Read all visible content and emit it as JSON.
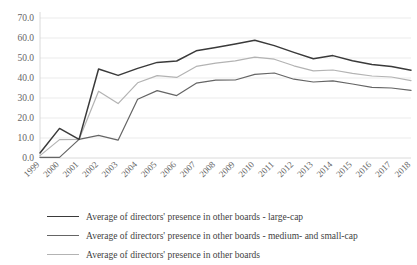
{
  "chart_data": {
    "type": "line",
    "title": "",
    "subtitle": "",
    "xlabel": "",
    "ylabel": "",
    "ylim": [
      0,
      70
    ],
    "ytick_step": 10,
    "ytick_labels": [
      "0.0",
      "10.0",
      "20.0",
      "30.0",
      "40.0",
      "50.0",
      "60.0",
      "70.0"
    ],
    "grid": true,
    "legend_position": "bottom",
    "categories": [
      "1999",
      "2000",
      "2001",
      "2002",
      "2003",
      "2004",
      "2005",
      "2006",
      "2007",
      "2008",
      "2009",
      "2010",
      "2011",
      "2012",
      "2013",
      "2014",
      "2015",
      "2016",
      "2017",
      "2018"
    ],
    "series": [
      {
        "name": "Average of directors' presence in other boards - large-cap",
        "color": "#3a3a3a",
        "values": [
          2.5,
          14.8,
          9.3,
          44.5,
          41.3,
          44.8,
          47.8,
          48.5,
          53.6,
          55.2,
          57.0,
          58.9,
          56.2,
          52.8,
          49.6,
          51.2,
          48.6,
          46.7,
          45.8,
          43.9
        ]
      },
      {
        "name": "Average of directors' presence in other boards - medium- and small-cap",
        "color": "#656565",
        "values": [
          0.3,
          0.3,
          9.3,
          11.3,
          8.9,
          29.4,
          33.7,
          31.2,
          37.4,
          38.9,
          39.0,
          41.8,
          42.5,
          39.4,
          38.0,
          38.6,
          37.0,
          35.3,
          35.0,
          33.8
        ]
      },
      {
        "name": "Average of directors' presence in other boards",
        "color": "#b3b3b3",
        "values": [
          1.2,
          9.2,
          9.3,
          33.4,
          27.2,
          37.6,
          41.2,
          40.3,
          45.8,
          47.4,
          48.6,
          50.4,
          49.4,
          46.1,
          43.6,
          44.0,
          42.3,
          41.0,
          40.5,
          38.7
        ]
      }
    ]
  },
  "legend": {
    "items": [
      {
        "label": "Average of directors' presence in other boards - large-cap"
      },
      {
        "label": "Average of directors' presence in other boards - medium- and small-cap"
      },
      {
        "label": "Average of directors' presence in other boards"
      }
    ]
  }
}
